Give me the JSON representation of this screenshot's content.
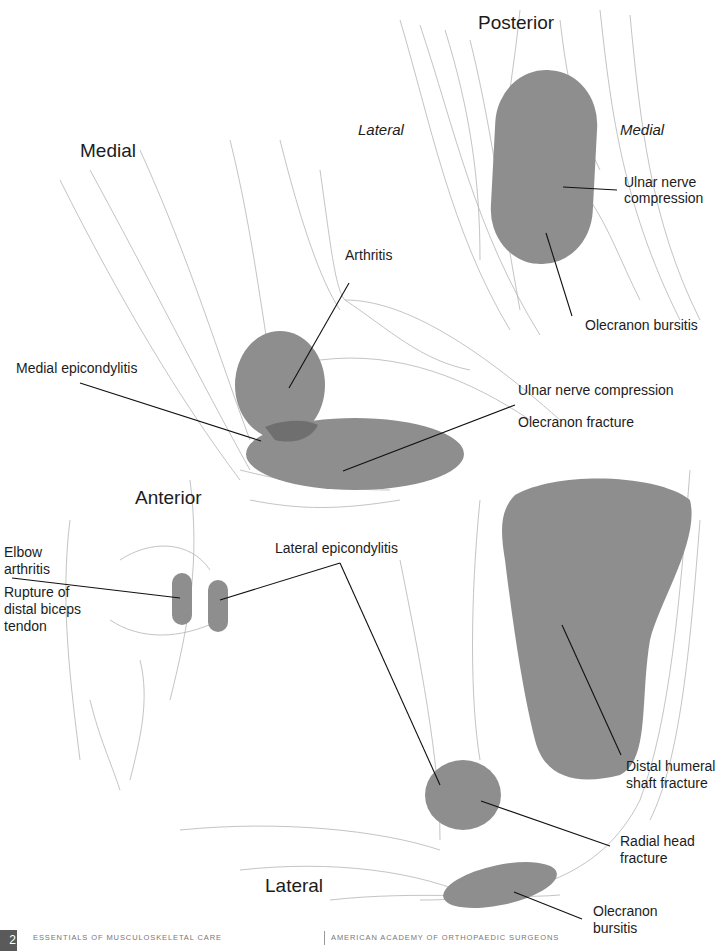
{
  "views": {
    "posterior": {
      "title": "Posterior",
      "side_left": "Lateral",
      "side_right": "Medial",
      "labels": [
        "Ulnar nerve compression",
        "Olecranon bursitis"
      ]
    },
    "medial": {
      "title": "Medial",
      "labels": [
        "Arthritis",
        "Medial epicondylitis",
        "Ulnar nerve compression",
        "Olecranon fracture"
      ]
    },
    "anterior": {
      "title": "Anterior",
      "labels": [
        "Elbow arthritis",
        "Rupture of distal biceps tendon",
        "Lateral epicondylitis"
      ]
    },
    "lateral": {
      "title": "Lateral",
      "labels": [
        "Distal humeral shaft fracture",
        "Radial head fracture",
        "Olecranon bursitis"
      ]
    }
  },
  "text": {
    "posterior_title": "Posterior",
    "lateral_side": "Lateral",
    "medial_side": "Medial",
    "ulnar_nerve_post_1": "Ulnar nerve",
    "ulnar_nerve_post_2": "compression",
    "olecranon_bursitis_post": "Olecranon bursitis",
    "medial_title": "Medial",
    "arthritis": "Arthritis",
    "medial_epicondylitis": "Medial epicondylitis",
    "ulnar_nerve_medial": "Ulnar nerve compression",
    "olecranon_fracture": "Olecranon fracture",
    "anterior_title": "Anterior",
    "elbow_arthritis_1": "Elbow",
    "elbow_arthritis_2": "arthritis",
    "biceps_1": "Rupture of",
    "biceps_2": "distal biceps",
    "biceps_3": "tendon",
    "lateral_epicondylitis": "Lateral epicondylitis",
    "lateral_title": "Lateral",
    "humeral_1": "Distal humeral",
    "humeral_2": "shaft fracture",
    "radial_1": "Radial head",
    "radial_2": "fracture",
    "olec_burs_lat_1": "Olecranon",
    "olec_burs_lat_2": "bursitis"
  },
  "colors": {
    "highlight": "#8e8e8e",
    "overlap": "#6f6f6f",
    "sketch": "#9a9a9a",
    "leader": "#111111"
  },
  "footer": {
    "page_number": "2",
    "book": "Essentials of Musculoskeletal Care",
    "publisher": "American Academy of Orthopaedic Surgeons"
  }
}
